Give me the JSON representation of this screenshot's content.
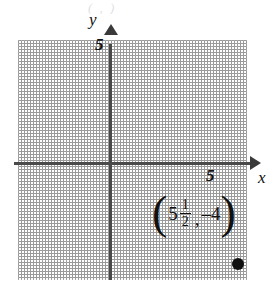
{
  "figure": {
    "type": "coordinate-plane",
    "title_remnant": "( , )",
    "axes": {
      "x_label": "x",
      "y_label": "y",
      "x_tick_label": "5",
      "y_tick_label": "5",
      "x_tick_value": 5,
      "y_tick_value": 5,
      "x_range": [
        -4,
        5.5
      ],
      "y_range": [
        -4.8,
        5.4
      ],
      "grid": true,
      "grid_style": "dotted",
      "grid_step": 1,
      "axis_color": "#4a4a4a",
      "grid_color": "#a8a8a8"
    },
    "points": [
      {
        "label_open_paren": "(",
        "x_whole": "5",
        "x_numerator": "1",
        "x_denominator": "2",
        "comma": ",",
        "y_value": "–4",
        "label_close_paren": ")",
        "x": 5.5,
        "y": -4,
        "dot_color": "#111111"
      }
    ]
  }
}
